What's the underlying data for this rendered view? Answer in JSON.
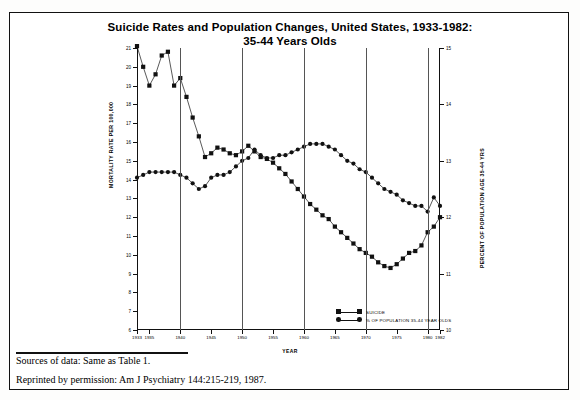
{
  "figure": {
    "title_line1": "Suicide Rates and Population Changes, United States, 1933-1982:",
    "title_line2": "35-44 Years Olds",
    "source_note": "Sources of data:  Same as Table 1.",
    "permission_note": "Reprinted by permission:  Am J Psychiatry 144:215-219, 1987."
  },
  "legend": {
    "items": [
      {
        "label": "SUICIDE",
        "marker": "square",
        "color": "#111111"
      },
      {
        "label": "% OF POPULATION 35-44 YEAR OLDS",
        "marker": "circle",
        "color": "#111111"
      }
    ]
  },
  "chart_data": {
    "type": "line",
    "title": "Suicide Rates and Population Changes, United States, 1933-1982: 35-44 Years Olds",
    "xlabel": "YEAR",
    "ylabel": "MORTALITY RATE PER 100,000",
    "ylabel_right": "PERCENT OF POPULATION AGE 35-44 YRS",
    "grid": false,
    "legend_position": "bottom-right",
    "xlim": [
      1933,
      1982
    ],
    "ylim": [
      6,
      21
    ],
    "ylim_right": [
      10,
      15
    ],
    "yticks": [
      6,
      7,
      8,
      9,
      10,
      11,
      12,
      13,
      14,
      15,
      16,
      17,
      18,
      19,
      20,
      21
    ],
    "yticks_right": [
      10,
      11,
      12,
      13,
      14,
      15
    ],
    "xticks": [
      1933,
      1935,
      1940,
      1945,
      1950,
      1955,
      1960,
      1965,
      1970,
      1975,
      1980,
      1982
    ],
    "xtick_labels": [
      "1933",
      "1935",
      "1940",
      "1945",
      "1950",
      "1955",
      "1960",
      "1965",
      "1970",
      "1975",
      "1980",
      "1982"
    ],
    "vertical_reference_lines": [
      1940,
      1950,
      1960,
      1970,
      1980
    ],
    "x": [
      1933,
      1934,
      1935,
      1936,
      1937,
      1938,
      1939,
      1940,
      1941,
      1942,
      1943,
      1944,
      1945,
      1946,
      1947,
      1948,
      1949,
      1950,
      1951,
      1952,
      1953,
      1954,
      1955,
      1956,
      1957,
      1958,
      1959,
      1960,
      1961,
      1962,
      1963,
      1964,
      1965,
      1966,
      1967,
      1968,
      1969,
      1970,
      1971,
      1972,
      1973,
      1974,
      1975,
      1976,
      1977,
      1978,
      1979,
      1980,
      1981,
      1982
    ],
    "series": [
      {
        "name": "SUICIDE",
        "axis": "left",
        "marker": "square",
        "color": "#111111",
        "values": [
          21.1,
          20.0,
          19.0,
          19.6,
          20.6,
          20.8,
          19.0,
          19.4,
          18.4,
          17.3,
          16.3,
          15.2,
          15.4,
          15.7,
          15.6,
          15.4,
          15.3,
          15.5,
          15.8,
          15.5,
          15.2,
          15.1,
          14.9,
          14.6,
          14.3,
          13.9,
          13.5,
          13.1,
          12.7,
          12.4,
          12.1,
          11.9,
          11.5,
          11.2,
          10.9,
          10.6,
          10.3,
          10.1,
          9.9,
          9.6,
          9.4,
          9.3,
          9.5,
          9.8,
          10.1,
          10.2,
          10.5,
          11.2,
          11.5,
          12.0
        ]
      },
      {
        "name": "% OF POPULATION 35-44 YEAR OLDS",
        "axis": "right",
        "marker": "circle",
        "color": "#111111",
        "values": [
          12.7,
          12.75,
          12.8,
          12.8,
          12.8,
          12.8,
          12.8,
          12.75,
          12.7,
          12.6,
          12.5,
          12.55,
          12.7,
          12.75,
          12.75,
          12.8,
          12.9,
          13.0,
          13.05,
          13.2,
          13.1,
          13.05,
          13.05,
          13.1,
          13.1,
          13.15,
          13.2,
          13.25,
          13.3,
          13.3,
          13.3,
          13.25,
          13.2,
          13.1,
          13.0,
          12.95,
          12.85,
          12.8,
          12.7,
          12.6,
          12.5,
          12.45,
          12.4,
          12.3,
          12.25,
          12.2,
          12.2,
          12.1,
          12.35,
          12.2
        ]
      }
    ]
  }
}
